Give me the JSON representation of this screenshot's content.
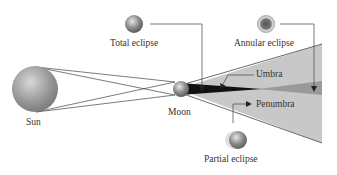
{
  "diagram": {
    "labels": {
      "total_eclipse": "Total eclipse",
      "annular_eclipse": "Annular eclipse",
      "umbra": "Umbra",
      "penumbra": "Penumbra",
      "sun": "Sun",
      "moon": "Moon",
      "partial_eclipse": "Partial eclipse"
    },
    "colors": {
      "penumbra_fill": "#c8c8c8",
      "umbra_fill": "#111111",
      "antumbra_fill": "#9a9a9a",
      "line": "#444444"
    }
  }
}
